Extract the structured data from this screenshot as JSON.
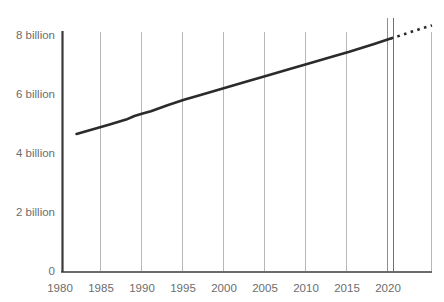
{
  "chart_data": {
    "type": "line",
    "title": "",
    "subtitle": "",
    "xlabel": "",
    "ylabel": "",
    "xlim": [
      1980,
      2025
    ],
    "ylim": [
      0,
      8000000000
    ],
    "grid": "vertical",
    "legend": "none",
    "y_ticks": [
      {
        "value": 0,
        "label": "0"
      },
      {
        "value": 2000000000,
        "label": "2 billion"
      },
      {
        "value": 4000000000,
        "label": "4 billion"
      },
      {
        "value": 6000000000,
        "label": "6 billion"
      },
      {
        "value": 8000000000,
        "label": "8 billion"
      }
    ],
    "x_ticks": [
      {
        "value": 1980,
        "label": "1980"
      },
      {
        "value": 1985,
        "label": "1985"
      },
      {
        "value": 1990,
        "label": "1990"
      },
      {
        "value": 1995,
        "label": "1995"
      },
      {
        "value": 2000,
        "label": "2000"
      },
      {
        "value": 2005,
        "label": "2005"
      },
      {
        "value": 2010,
        "label": "2010"
      },
      {
        "value": 2015,
        "label": "2015"
      },
      {
        "value": 2020,
        "label": "2020"
      }
    ],
    "series": [
      {
        "name": "World population (historical)",
        "style": "solid",
        "color": "#2b2b2b",
        "x": [
          1982,
          1984,
          1986,
          1988,
          1989,
          1990,
          1991,
          1993,
          1995,
          1997,
          2000,
          2003,
          2005,
          2008,
          2010,
          2013,
          2015,
          2018,
          2020
        ],
        "values": [
          4600000000,
          4760000000,
          4920000000,
          5080000000,
          5200000000,
          5280000000,
          5360000000,
          5560000000,
          5740000000,
          5900000000,
          6140000000,
          6380000000,
          6540000000,
          6780000000,
          6940000000,
          7180000000,
          7340000000,
          7600000000,
          7780000000
        ]
      },
      {
        "name": "World population (projected)",
        "style": "dotted",
        "color": "#2b2b2b",
        "x": [
          2020,
          2022,
          2024,
          2025
        ],
        "values": [
          7780000000,
          7960000000,
          8140000000,
          8220000000
        ]
      }
    ],
    "markers": [
      {
        "name": "current-year-marker",
        "value": 2020.6,
        "color": "#555555"
      }
    ]
  }
}
